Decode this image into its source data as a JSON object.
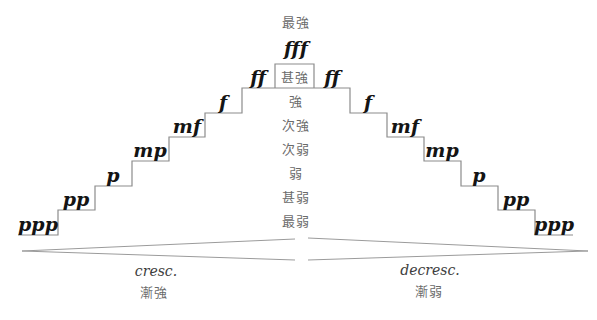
{
  "colors": {
    "background": "#ffffff",
    "line": "#8c8c8c",
    "hairpin_line": "#9b9b9b",
    "dynamics_text": "#141414",
    "cjk_text": "#6b6b6b",
    "term_text": "#3d3d3d"
  },
  "center_column": {
    "top_label": "最強",
    "peak_dynamic": "fff",
    "levels": [
      "甚強",
      "強",
      "次強",
      "次弱",
      "弱",
      "甚弱",
      "最弱"
    ]
  },
  "left_staircase": {
    "dynamics": [
      "ppp",
      "pp",
      "p",
      "mp",
      "mf",
      "f",
      "ff"
    ]
  },
  "right_staircase": {
    "dynamics": [
      "ff",
      "f",
      "mf",
      "mp",
      "p",
      "pp",
      "ppp"
    ]
  },
  "crescendo": {
    "term": "cresc.",
    "zh": "漸強"
  },
  "decrescendo": {
    "term": "decresc.",
    "zh": "漸弱"
  }
}
